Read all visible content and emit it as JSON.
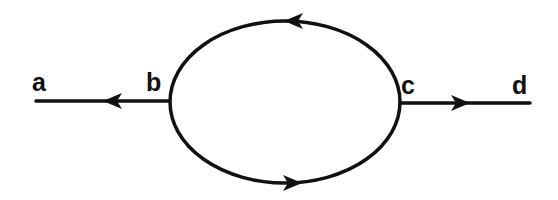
{
  "diagram": {
    "type": "circuit-loop",
    "stroke_color": "#111111",
    "background": "#ffffff",
    "nodes": [
      {
        "id": "a",
        "label": "a",
        "x": 42,
        "y": 91
      },
      {
        "id": "b",
        "label": "b",
        "x": 155,
        "y": 91
      },
      {
        "id": "c",
        "label": "c",
        "x": 409,
        "y": 94
      },
      {
        "id": "d",
        "label": "d",
        "x": 521,
        "y": 94
      }
    ],
    "edges": [
      {
        "id": "b-a",
        "from": "b",
        "to": "a",
        "shape": "line",
        "arrow": "left"
      },
      {
        "id": "c-d",
        "from": "c",
        "to": "d",
        "shape": "line",
        "arrow": "right"
      },
      {
        "id": "upper-arc",
        "from": "c",
        "to": "b",
        "shape": "arc",
        "arrow": "left"
      },
      {
        "id": "lower-arc",
        "from": "b",
        "to": "c",
        "shape": "arc",
        "arrow": "right"
      }
    ]
  }
}
